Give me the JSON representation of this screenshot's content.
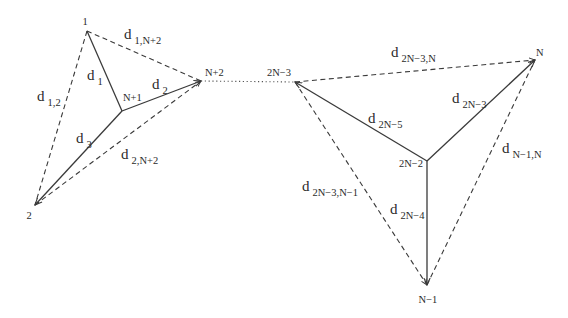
{
  "diagram": {
    "width": 568,
    "height": 318,
    "colors": {
      "line": "#3a3a3a",
      "text": "#2a2a2a",
      "background": "#ffffff"
    },
    "nodes": [
      {
        "id": "1",
        "label": "1",
        "x": 87,
        "y": 31,
        "lx": 85,
        "ly": 25,
        "anchor": "middle"
      },
      {
        "id": "2",
        "label": "2",
        "x": 35,
        "y": 205,
        "lx": 29,
        "ly": 219,
        "anchor": "middle"
      },
      {
        "id": "N+1",
        "label": "N+1",
        "x": 122,
        "y": 111,
        "lx": 123,
        "ly": 101,
        "anchor": "start"
      },
      {
        "id": "N+2",
        "label": "N+2",
        "x": 201,
        "y": 81,
        "lx": 205,
        "ly": 76,
        "anchor": "start"
      },
      {
        "id": "2N-3",
        "label": "2N−3",
        "x": 295,
        "y": 82,
        "lx": 291,
        "ly": 76,
        "anchor": "end"
      },
      {
        "id": "N",
        "label": "N",
        "x": 535,
        "y": 60,
        "lx": 536,
        "ly": 56,
        "anchor": "start"
      },
      {
        "id": "2N-2",
        "label": "2N−2",
        "x": 427,
        "y": 161,
        "lx": 423,
        "ly": 167,
        "anchor": "end"
      },
      {
        "id": "N-1",
        "label": "N−1",
        "x": 427,
        "y": 285,
        "lx": 428,
        "ly": 303,
        "anchor": "middle"
      }
    ],
    "edges": [
      {
        "from": "1",
        "to": "N+1",
        "style": "solid",
        "arrow": false
      },
      {
        "from": "N+1",
        "to": "N+2",
        "style": "solid",
        "arrow": true
      },
      {
        "from": "N+1",
        "to": "2",
        "style": "solid",
        "arrow": true
      },
      {
        "from": "1",
        "to": "N+2",
        "style": "dashed",
        "arrow": false
      },
      {
        "from": "1",
        "to": "2",
        "style": "dashed",
        "arrow": false
      },
      {
        "from": "2",
        "to": "N+2",
        "style": "dashed",
        "arrow": true
      },
      {
        "from": "N+2",
        "to": "2N-3",
        "style": "dotted",
        "arrow": false
      },
      {
        "from": "2N-3",
        "to": "N",
        "style": "dashed",
        "arrow": true
      },
      {
        "from": "2N-2",
        "to": "2N-3",
        "style": "solid",
        "arrow": true
      },
      {
        "from": "2N-2",
        "to": "N",
        "style": "solid",
        "arrow": true
      },
      {
        "from": "2N-2",
        "to": "N-1",
        "style": "solid",
        "arrow": true
      },
      {
        "from": "2N-3",
        "to": "N-1",
        "style": "dashed",
        "arrow": true
      },
      {
        "from": "N-1",
        "to": "N",
        "style": "dashed",
        "arrow": false
      }
    ],
    "edge_labels": [
      {
        "base": "d",
        "sub": "1,N+2",
        "x": 124,
        "y": 39
      },
      {
        "base": "d",
        "sub": "1",
        "x": 87,
        "y": 80
      },
      {
        "base": "d",
        "sub": "2",
        "x": 152,
        "y": 89
      },
      {
        "base": "d",
        "sub": "1,2",
        "x": 37,
        "y": 101
      },
      {
        "base": "d",
        "sub": "3",
        "x": 76,
        "y": 143
      },
      {
        "base": "d",
        "sub": "2,N+2",
        "x": 121,
        "y": 159
      },
      {
        "base": "d",
        "sub": "2N−3,N",
        "x": 391,
        "y": 57
      },
      {
        "base": "d",
        "sub": "2N−3",
        "x": 452,
        "y": 103
      },
      {
        "base": "d",
        "sub": "2N−5",
        "x": 368,
        "y": 123
      },
      {
        "base": "d",
        "sub": "N−1,N",
        "x": 502,
        "y": 153
      },
      {
        "base": "d",
        "sub": "2N−3,N−1",
        "x": 302,
        "y": 191
      },
      {
        "base": "d",
        "sub": "2N−4",
        "x": 390,
        "y": 214
      }
    ]
  }
}
